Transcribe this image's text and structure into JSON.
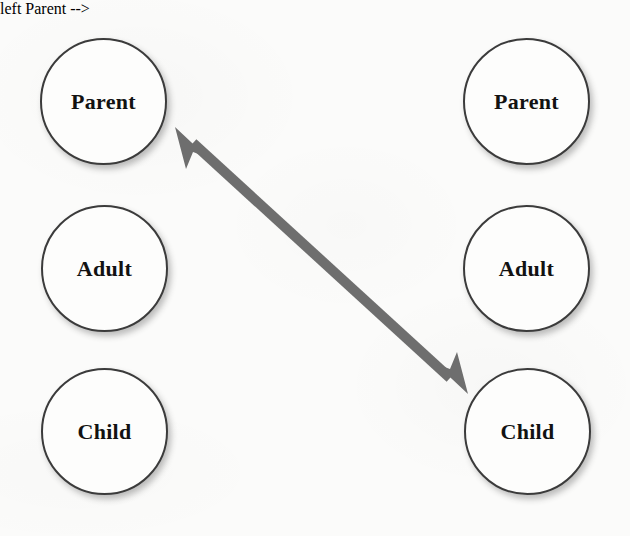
{
  "diagram": {
    "background_color": "#fbfbfa",
    "circle_stroke_color": "#3b3b3b",
    "circle_fill_color": "#fdfdfc",
    "label_color": "#121212",
    "arrow_color": "#6e6e6e",
    "columns": [
      {
        "name": "left-person",
        "states": [
          {
            "key": "parent",
            "label": "Parent",
            "x": 40,
            "y": 38
          },
          {
            "key": "adult",
            "label": "Adult",
            "x": 41,
            "y": 205
          },
          {
            "key": "child",
            "label": "Child",
            "x": 41,
            "y": 368
          }
        ]
      },
      {
        "name": "right-person",
        "states": [
          {
            "key": "parent",
            "label": "Parent",
            "x": 463,
            "y": 38
          },
          {
            "key": "adult",
            "label": "Adult",
            "x": 463,
            "y": 205
          },
          {
            "key": "child",
            "label": "Child",
            "x": 464,
            "y": 368
          }
        ]
      }
    ],
    "arrow": {
      "name": "crossed-transaction-arrow",
      "style": "double-headed",
      "from": {
        "column": "right-person",
        "state": "child",
        "x": 468,
        "y": 394
      },
      "to": {
        "column": "left-person",
        "state": "parent",
        "x": 175,
        "y": 127
      },
      "color": "#6e6e6e",
      "shaft_width": 10,
      "head_length": 30,
      "head_width": 27
    }
  }
}
